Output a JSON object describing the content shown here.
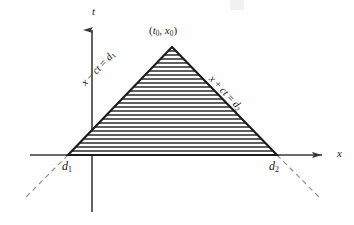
{
  "figure": {
    "kind": "spacetime-characteristic-triangle-diagram",
    "background_color": "#fefefe",
    "ink_color": "#1b1b1b",
    "axis_color": "#3a3a3a",
    "hatch_color": "#2b2b2b",
    "dash_color": "#8d8d8d"
  },
  "axes": {
    "vertical": {
      "label": "t",
      "arrow": "up",
      "x": 92,
      "y_top": 20,
      "y_bottom": 212
    },
    "horizontal": {
      "label": "x",
      "arrow": "right",
      "y": 155,
      "x_left": 30,
      "x_right": 331
    }
  },
  "region": {
    "name": "domain-of-dependence",
    "apex_label_prefix": "(",
    "apex_label_t": "t",
    "apex_label_t_sub": "0",
    "apex_label_sep": ", ",
    "apex_label_x": "x",
    "apex_label_x_sub": "0",
    "apex_label_suffix": ")",
    "apex_point": [
      172,
      47
    ],
    "base_left_point": [
      68,
      155
    ],
    "base_right_point": [
      277,
      155
    ],
    "fill": "horizontal-hatching",
    "hatch_spacing_px": 4
  },
  "edges": {
    "left": {
      "var": "x",
      "op": " − ",
      "term": "ct",
      "eq": " = ",
      "value": "d",
      "value_sub": "1",
      "full_text": "x − ct = d1"
    },
    "right": {
      "var": "x",
      "op": " + ",
      "term": "ct",
      "eq": " = ",
      "value": "d",
      "value_sub": "2",
      "full_text": "x + ct = d2"
    }
  },
  "base_points": {
    "left": {
      "symbol": "d",
      "sub": "1"
    },
    "right": {
      "symbol": "d",
      "sub": "2"
    }
  },
  "dashed_extensions": {
    "left": {
      "from": [
        68,
        155
      ],
      "to": [
        24,
        199
      ]
    },
    "right": {
      "from": [
        277,
        155
      ],
      "to": [
        321,
        199
      ]
    },
    "style": "dashed"
  }
}
